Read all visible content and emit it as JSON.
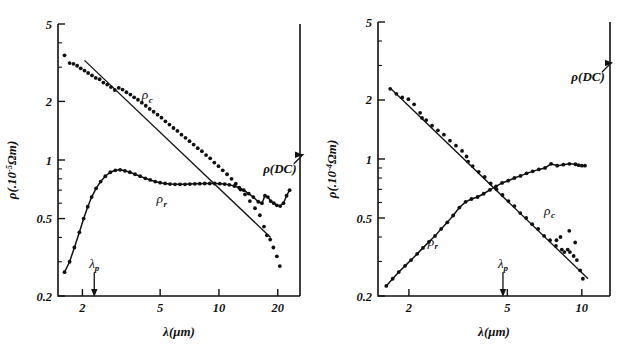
{
  "figure": {
    "panels": [
      "left",
      "right"
    ],
    "background_color": "#ffffff",
    "ink_color": "#111111"
  },
  "left": {
    "ylabel_main": "ρ(.10",
    "ylabel_exp": "-5",
    "ylabel_tail": "Ωm)",
    "xlabel": "λ(μm)",
    "ytick_labels": [
      "5",
      "2",
      "1",
      "0.5",
      "0.2"
    ],
    "xtick_labels": [
      "2",
      "5",
      "10",
      "20"
    ],
    "label_rho_c": "ρ",
    "label_rho_c_sub": "c",
    "label_rho_r": "ρ",
    "label_rho_r_sub": "r",
    "label_dc": "ρ(DC)",
    "label_lambda_p": "λ",
    "label_lambda_p_sub": "p"
  },
  "right": {
    "ylabel_main": "ρ(.10",
    "ylabel_exp": "-4",
    "ylabel_tail": "Ωm)",
    "xlabel": "λ(μm)",
    "ytick_labels": [
      "5",
      "2",
      "1",
      "0.5",
      "0.2"
    ],
    "xtick_labels": [
      "2",
      "5",
      "10"
    ],
    "label_rho_c": "ρ",
    "label_rho_c_sub": "c",
    "label_rho_r": "ρ",
    "label_rho_r_sub": "r",
    "label_dc": "ρ(DC)",
    "label_lambda_p": "λ",
    "label_lambda_p_sub": "p"
  },
  "chart_data": [
    {
      "type": "scatter",
      "panel": "left",
      "title": "",
      "xlabel": "λ(μm)",
      "ylabel": "ρ(.10^-5 Ωm)",
      "xscale": "log",
      "yscale": "log",
      "xlim": [
        1.5,
        26
      ],
      "ylim": [
        0.2,
        5
      ],
      "xticks": [
        2,
        5,
        10,
        20
      ],
      "yticks": [
        0.2,
        0.5,
        1,
        2,
        5
      ],
      "grid": false,
      "legend": "inline-annotations",
      "annotations": [
        {
          "text": "ρ_c",
          "x": 4.3,
          "y": 2.05
        },
        {
          "text": "ρ_r",
          "x": 5.1,
          "y": 0.6
        },
        {
          "text": "ρ(DC)",
          "x": 20.5,
          "y": 0.86
        },
        {
          "text": "λ_p",
          "x": 2.3,
          "y": 0.235,
          "arrow": "down-to-axis"
        }
      ],
      "series": [
        {
          "name": "ρ_c",
          "marker": "dot",
          "x": [
            1.62,
            1.72,
            1.8,
            1.88,
            1.96,
            2.05,
            2.14,
            2.24,
            2.34,
            2.45,
            2.56,
            2.68,
            2.8,
            2.93,
            3.07,
            3.21,
            3.36,
            3.52,
            3.68,
            3.85,
            4.03,
            4.22,
            4.42,
            4.63,
            4.85,
            5.08,
            5.32,
            5.58,
            5.85,
            6.13,
            6.43,
            6.74,
            7.07,
            7.42,
            7.79,
            8.18,
            8.59,
            9.02,
            9.47,
            9.95,
            10.46,
            11.0,
            11.6,
            12.2,
            12.9,
            13.6,
            14.4,
            15.3,
            16.2,
            17.0,
            17.6,
            18.3,
            19.0,
            19.8,
            20.5
          ],
          "y": [
            3.45,
            3.15,
            3.12,
            3.05,
            2.96,
            2.88,
            2.8,
            2.72,
            2.64,
            2.6,
            2.5,
            2.44,
            2.37,
            2.29,
            2.35,
            2.3,
            2.23,
            2.17,
            2.1,
            2.04,
            1.97,
            1.9,
            1.83,
            1.77,
            1.71,
            1.65,
            1.58,
            1.52,
            1.46,
            1.41,
            1.35,
            1.3,
            1.25,
            1.2,
            1.15,
            1.11,
            1.06,
            1.02,
            0.97,
            0.93,
            0.885,
            0.845,
            0.8,
            0.755,
            0.705,
            0.665,
            0.615,
            0.565,
            0.52,
            0.455,
            0.41,
            0.39,
            0.355,
            0.32,
            0.285
          ]
        },
        {
          "name": "ρ_c fit line",
          "marker": "line",
          "x": [
            2.05,
            18.4
          ],
          "y": [
            3.25,
            0.4
          ]
        },
        {
          "name": "ρ_r",
          "marker": "dot-with-curve",
          "x": [
            1.62,
            1.72,
            1.82,
            1.93,
            2.03,
            2.13,
            2.23,
            2.35,
            2.48,
            2.62,
            2.78,
            2.95,
            3.12,
            3.3,
            3.5,
            3.72,
            3.95,
            4.2,
            4.45,
            4.72,
            5.0,
            5.3,
            5.62,
            5.96,
            6.32,
            6.7,
            7.1,
            7.53,
            7.98,
            8.46,
            8.97,
            9.51,
            10.1,
            10.7,
            11.3,
            12.0,
            12.7,
            13.4,
            14.2,
            15.0,
            15.9,
            16.6,
            17.2,
            17.8,
            18.4,
            19.1,
            19.8,
            20.6,
            21.4,
            22.2,
            23.0
          ],
          "y": [
            0.265,
            0.3,
            0.355,
            0.425,
            0.5,
            0.575,
            0.645,
            0.715,
            0.775,
            0.825,
            0.865,
            0.885,
            0.89,
            0.88,
            0.865,
            0.845,
            0.825,
            0.805,
            0.79,
            0.775,
            0.765,
            0.758,
            0.752,
            0.75,
            0.75,
            0.75,
            0.752,
            0.754,
            0.756,
            0.757,
            0.757,
            0.757,
            0.756,
            0.752,
            0.745,
            0.735,
            0.72,
            0.7,
            0.672,
            0.645,
            0.61,
            0.6,
            0.655,
            0.645,
            0.615,
            0.6,
            0.585,
            0.58,
            0.6,
            0.655,
            0.7
          ]
        },
        {
          "name": "ρ(DC) marker",
          "marker": "arrow-to-right-axis",
          "x": [
            25.5
          ],
          "y": [
            0.73
          ]
        }
      ]
    },
    {
      "type": "scatter",
      "panel": "right",
      "title": "",
      "xlabel": "λ(μm)",
      "ylabel": "ρ(.10^-4 Ωm)",
      "xscale": "log",
      "yscale": "log",
      "xlim": [
        1.5,
        13
      ],
      "ylim": [
        0.2,
        5
      ],
      "xticks": [
        2,
        5,
        10
      ],
      "yticks": [
        0.2,
        0.5,
        1,
        2,
        5
      ],
      "grid": false,
      "legend": "inline-annotations",
      "annotations": [
        {
          "text": "ρ_c",
          "x": 7.4,
          "y": 0.52
        },
        {
          "text": "ρ_r",
          "x": 2.5,
          "y": 0.36
        },
        {
          "text": "ρ(DC)",
          "x": 10.6,
          "y": 2.5
        },
        {
          "text": "λ_p",
          "x": 4.8,
          "y": 0.235,
          "arrow": "down-to-axis"
        }
      ],
      "series": [
        {
          "name": "ρ_c",
          "marker": "dot",
          "x": [
            1.68,
            1.78,
            1.88,
            1.99,
            2.1,
            2.22,
            2.26,
            2.35,
            2.48,
            2.62,
            2.77,
            2.93,
            3.1,
            3.28,
            3.42,
            3.47,
            3.62,
            3.83,
            4.05,
            4.28,
            4.52,
            4.78,
            5.05,
            5.34,
            5.64,
            5.96,
            6.3,
            6.66,
            7.04,
            7.44,
            7.86,
            8.3,
            8.5,
            8.77,
            8.95,
            9.27,
            9.55,
            9.85,
            10.1,
            7.9,
            8.2,
            8.9,
            9.4
          ],
          "y": [
            2.28,
            2.15,
            2.06,
            2.02,
            1.9,
            1.72,
            1.62,
            1.58,
            1.48,
            1.4,
            1.33,
            1.24,
            1.17,
            1.1,
            1.03,
            0.97,
            0.92,
            0.86,
            0.81,
            0.75,
            0.7,
            0.655,
            0.61,
            0.575,
            0.53,
            0.5,
            0.465,
            0.44,
            0.405,
            0.385,
            0.36,
            0.345,
            0.335,
            0.345,
            0.335,
            0.32,
            0.305,
            0.27,
            0.245,
            0.385,
            0.4,
            0.43,
            0.375
          ]
        },
        {
          "name": "ρ_c fit line",
          "marker": "line",
          "x": [
            1.7,
            10.6
          ],
          "y": [
            2.27,
            0.245
          ]
        },
        {
          "name": "ρ_r",
          "marker": "dot-with-curve",
          "x": [
            1.62,
            1.72,
            1.82,
            1.93,
            2.04,
            2.16,
            2.28,
            2.41,
            2.55,
            2.7,
            2.86,
            3.02,
            3.2,
            3.39,
            3.58,
            3.79,
            4.01,
            4.25,
            4.5,
            4.76,
            5.04,
            5.34,
            5.65,
            5.98,
            6.33,
            6.7,
            7.1,
            7.51,
            7.95,
            8.42,
            8.91,
            9.43,
            9.7,
            10.0,
            10.3
          ],
          "y": [
            0.225,
            0.245,
            0.265,
            0.285,
            0.305,
            0.328,
            0.352,
            0.378,
            0.405,
            0.44,
            0.475,
            0.515,
            0.565,
            0.605,
            0.625,
            0.64,
            0.665,
            0.695,
            0.725,
            0.755,
            0.775,
            0.8,
            0.82,
            0.845,
            0.865,
            0.885,
            0.9,
            0.945,
            0.925,
            0.935,
            0.945,
            0.94,
            0.93,
            0.925,
            0.925
          ]
        },
        {
          "name": "ρ(DC) marker",
          "marker": "arrow-to-right-axis",
          "x": [
            12.6
          ],
          "y": [
            3.3
          ]
        }
      ]
    }
  ]
}
